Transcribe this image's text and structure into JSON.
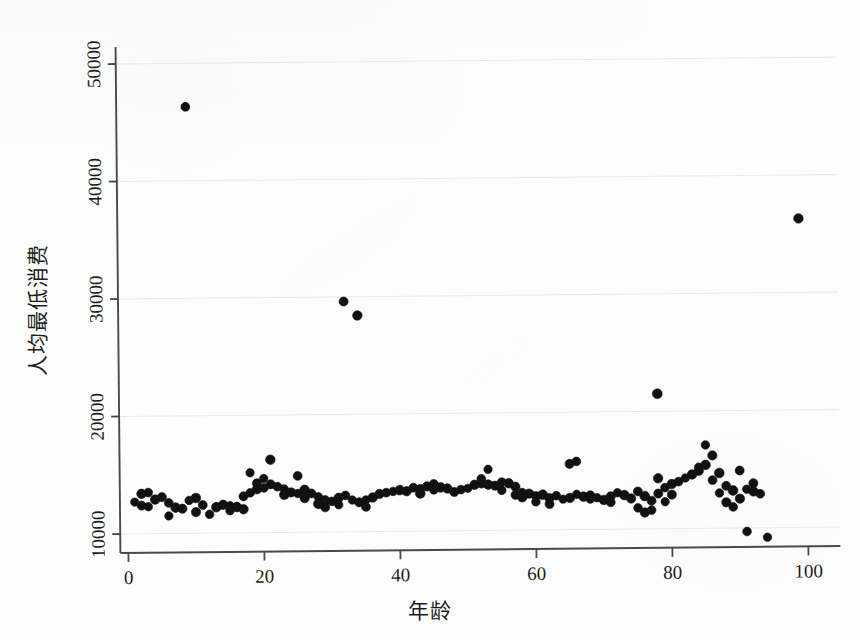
{
  "figure": {
    "background_color": "#fefefe",
    "marker_color": "#111111",
    "axis_color": "#4a4a4a",
    "grid_color": "#e8e8e8"
  },
  "chart_data": {
    "type": "scatter",
    "title": "",
    "xlabel": "年龄",
    "ylabel": "人均最低消费",
    "xlim": [
      0,
      102
    ],
    "ylim": [
      8600,
      52000
    ],
    "xticks": [
      0,
      20,
      40,
      60,
      80,
      100
    ],
    "xtick_labels": [
      "0",
      "20",
      "40",
      "60",
      "80",
      "100"
    ],
    "yticks": [
      10000,
      20000,
      30000,
      40000,
      50000
    ],
    "ytick_labels": [
      "10000",
      "20000",
      "30000",
      "40000",
      "50000"
    ],
    "grid": "horizontal-faint",
    "legend": "none",
    "marker_size_px": 9,
    "points": [
      [
        1,
        12700
      ],
      [
        2,
        13400
      ],
      [
        2,
        12400
      ],
      [
        3,
        13500
      ],
      [
        3,
        12300
      ],
      [
        4,
        12900
      ],
      [
        5,
        13100
      ],
      [
        6,
        12600
      ],
      [
        6,
        11500
      ],
      [
        7,
        12200
      ],
      [
        8,
        12100
      ],
      [
        9,
        46300
      ],
      [
        9,
        12800
      ],
      [
        10,
        13000
      ],
      [
        10,
        11800
      ],
      [
        11,
        12400
      ],
      [
        12,
        11600
      ],
      [
        13,
        12200
      ],
      [
        14,
        12400
      ],
      [
        15,
        12300
      ],
      [
        15,
        11900
      ],
      [
        16,
        12200
      ],
      [
        17,
        12000
      ],
      [
        17,
        13100
      ],
      [
        18,
        13400
      ],
      [
        18,
        15100
      ],
      [
        19,
        13700
      ],
      [
        19,
        14200
      ],
      [
        20,
        13800
      ],
      [
        20,
        14600
      ],
      [
        21,
        16200
      ],
      [
        21,
        14100
      ],
      [
        22,
        13900
      ],
      [
        23,
        13700
      ],
      [
        23,
        13200
      ],
      [
        24,
        13400
      ],
      [
        25,
        14800
      ],
      [
        25,
        13300
      ],
      [
        26,
        13600
      ],
      [
        26,
        12900
      ],
      [
        27,
        13300
      ],
      [
        28,
        13000
      ],
      [
        28,
        12400
      ],
      [
        29,
        12700
      ],
      [
        29,
        12100
      ],
      [
        30,
        12600
      ],
      [
        31,
        12300
      ],
      [
        31,
        12900
      ],
      [
        32,
        29600
      ],
      [
        32,
        13100
      ],
      [
        33,
        12700
      ],
      [
        34,
        28400
      ],
      [
        34,
        12500
      ],
      [
        35,
        12100
      ],
      [
        35,
        12700
      ],
      [
        36,
        12900
      ],
      [
        37,
        13200
      ],
      [
        38,
        13300
      ],
      [
        39,
        13400
      ],
      [
        40,
        13500
      ],
      [
        41,
        13400
      ],
      [
        42,
        13700
      ],
      [
        43,
        13600
      ],
      [
        43,
        13200
      ],
      [
        44,
        13800
      ],
      [
        45,
        14000
      ],
      [
        45,
        13500
      ],
      [
        46,
        13700
      ],
      [
        47,
        13600
      ],
      [
        48,
        13300
      ],
      [
        49,
        13500
      ],
      [
        50,
        13600
      ],
      [
        51,
        13900
      ],
      [
        52,
        14000
      ],
      [
        52,
        14400
      ],
      [
        53,
        15200
      ],
      [
        53,
        13900
      ],
      [
        54,
        13800
      ],
      [
        55,
        14100
      ],
      [
        55,
        13400
      ],
      [
        56,
        14000
      ],
      [
        57,
        13700
      ],
      [
        57,
        13000
      ],
      [
        58,
        13200
      ],
      [
        58,
        12800
      ],
      [
        59,
        13100
      ],
      [
        60,
        12900
      ],
      [
        60,
        12400
      ],
      [
        61,
        13000
      ],
      [
        62,
        12700
      ],
      [
        62,
        12200
      ],
      [
        63,
        12900
      ],
      [
        64,
        12600
      ],
      [
        65,
        12700
      ],
      [
        65,
        15600
      ],
      [
        66,
        15800
      ],
      [
        66,
        13000
      ],
      [
        67,
        12800
      ],
      [
        68,
        12900
      ],
      [
        68,
        12600
      ],
      [
        69,
        12700
      ],
      [
        70,
        12500
      ],
      [
        71,
        12800
      ],
      [
        71,
        12300
      ],
      [
        72,
        13100
      ],
      [
        73,
        12900
      ],
      [
        74,
        12600
      ],
      [
        75,
        13200
      ],
      [
        75,
        11800
      ],
      [
        76,
        12800
      ],
      [
        76,
        11400
      ],
      [
        77,
        12400
      ],
      [
        77,
        11600
      ],
      [
        78,
        21500
      ],
      [
        78,
        14300
      ],
      [
        78,
        13000
      ],
      [
        79,
        13500
      ],
      [
        79,
        12300
      ],
      [
        80,
        13800
      ],
      [
        80,
        12900
      ],
      [
        81,
        14000
      ],
      [
        82,
        14300
      ],
      [
        83,
        14600
      ],
      [
        84,
        14900
      ],
      [
        84,
        15200
      ],
      [
        85,
        17100
      ],
      [
        85,
        15400
      ],
      [
        86,
        16200
      ],
      [
        86,
        14100
      ],
      [
        87,
        13000
      ],
      [
        87,
        14700
      ],
      [
        88,
        12200
      ],
      [
        88,
        13600
      ],
      [
        89,
        11800
      ],
      [
        89,
        13200
      ],
      [
        90,
        12500
      ],
      [
        90,
        14900
      ],
      [
        91,
        9700
      ],
      [
        91,
        13300
      ],
      [
        92,
        13100
      ],
      [
        92,
        13800
      ],
      [
        93,
        12900
      ],
      [
        94,
        9200
      ],
      [
        99,
        36300
      ]
    ]
  },
  "axis_titles": {
    "x": "年龄",
    "y": "人均最低消费"
  }
}
